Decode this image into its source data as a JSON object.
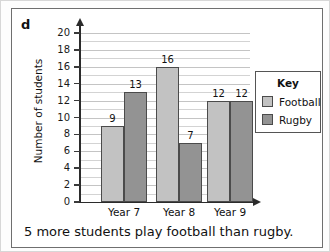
{
  "part_letter": "d",
  "caption": "5 more students play football than rugby.",
  "legend": {
    "title": "Key",
    "items": [
      {
        "label": "Football",
        "color": "#c2c2c2",
        "swatch_name": "legend-swatch-football"
      },
      {
        "label": "Rugby",
        "color": "#939393",
        "swatch_name": "legend-swatch-rugby"
      }
    ]
  },
  "chart_data": {
    "type": "bar",
    "title": "",
    "xlabel": "",
    "ylabel": "Number of students",
    "categories": [
      "Year 7",
      "Year 8",
      "Year 9"
    ],
    "series": [
      {
        "name": "Football",
        "color": "#c2c2c2",
        "values": [
          9,
          16,
          12
        ]
      },
      {
        "name": "Rugby",
        "color": "#939393",
        "values": [
          13,
          7,
          12
        ]
      }
    ],
    "ylim": [
      0,
      20
    ],
    "ytick_step": 2,
    "yticks": [
      20,
      18,
      16,
      14,
      12,
      10,
      8,
      6,
      4,
      2,
      0
    ],
    "ytick_labels": [
      "20",
      "18",
      "16",
      "14",
      "12",
      "10",
      "8",
      "6",
      "4",
      "2",
      "0"
    ],
    "gridlines": true,
    "gridline_step": 1,
    "legend_position": "right",
    "data_labels": [
      {
        "text": "9",
        "series": "Football",
        "category": "Year 7"
      },
      {
        "text": "13",
        "series": "Rugby",
        "category": "Year 7"
      },
      {
        "text": "16",
        "series": "Football",
        "category": "Year 8"
      },
      {
        "text": "7",
        "series": "Rugby",
        "category": "Year 8"
      },
      {
        "text": "12",
        "series": "Football",
        "category": "Year 9"
      },
      {
        "text": "12",
        "series": "Rugby",
        "category": "Year 9"
      }
    ]
  }
}
